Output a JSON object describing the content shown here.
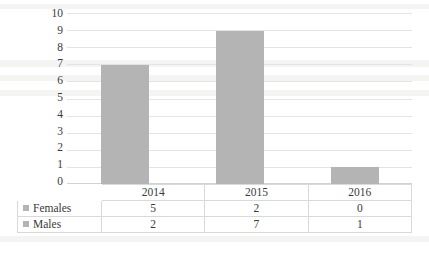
{
  "chart_data": {
    "type": "bar",
    "title": "",
    "subtitle": "",
    "xlabel": "",
    "ylabel": "",
    "categories": [
      "2014",
      "2015",
      "2016"
    ],
    "ylim": [
      0,
      10
    ],
    "ytick_step": 1,
    "yticks": [
      "10",
      "9",
      "8",
      "7",
      "6",
      "5",
      "4",
      "3",
      "2",
      "1",
      "0"
    ],
    "grid": true,
    "legend_position": "data-table-left",
    "bar_color": "#b4b4b4",
    "grid_color": "#e3e3e3",
    "stacked": true,
    "bar_totals": [
      7,
      9,
      1
    ],
    "series": [
      {
        "name": "Females",
        "values": [
          5,
          2,
          0
        ]
      },
      {
        "name": "Males",
        "values": [
          2,
          7,
          1
        ]
      }
    ],
    "data_table": {
      "corner_label": "",
      "column_headers": [
        "2014",
        "2015",
        "2016"
      ],
      "rows": [
        {
          "label": "Females",
          "marker": "legend-swatch",
          "cells": [
            "5",
            "2",
            "0"
          ]
        },
        {
          "label": "Males",
          "marker": "legend-swatch",
          "cells": [
            "2",
            "7",
            "1"
          ]
        }
      ]
    }
  }
}
